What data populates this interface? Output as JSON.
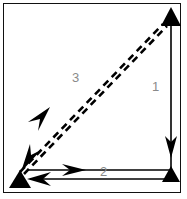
{
  "figure": {
    "frame": {
      "border_color": "#111111",
      "background_color": "#ffffff"
    },
    "colors": {
      "stroke": "#000000",
      "label_text": "#8a8a8a",
      "frame": "#111111",
      "background": "#ffffff"
    },
    "labels": {
      "leg_1": "1",
      "leg_2": "2",
      "leg_3": "3"
    },
    "vertices": [
      {
        "name": "top-right-vertex",
        "x": 171,
        "y": 17,
        "marker": "filled-triangle-up"
      },
      {
        "name": "bottom-right-vertex",
        "x": 171,
        "y": 176,
        "marker": "filled-triangle-up"
      },
      {
        "name": "bottom-left-vertex",
        "x": 20,
        "y": 180,
        "marker": "filled-triangle-up"
      }
    ],
    "legs": [
      {
        "id": "leg-1",
        "label": "1",
        "style": "solid",
        "orientation": "vertical",
        "direction": "downward",
        "from": "top-right-vertex",
        "to": "bottom-right-vertex",
        "arrowheads": 1
      },
      {
        "id": "leg-2",
        "label": "2",
        "style": "solid",
        "orientation": "horizontal",
        "direction": "bidirectional",
        "from": "bottom-left-vertex",
        "to": "bottom-right-vertex",
        "arrowheads": 2
      },
      {
        "id": "leg-3",
        "label": "3",
        "style": "dashed",
        "orientation": "diagonal",
        "direction": "down-left",
        "from": "top-right-vertex",
        "to": "bottom-left-vertex",
        "arrowheads": 2
      }
    ]
  }
}
